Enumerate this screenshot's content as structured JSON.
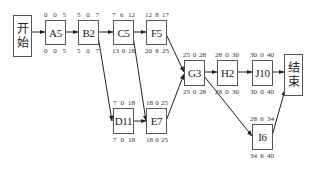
{
  "diagram": {
    "type": "activity-on-node network (critical path)",
    "start_node": {
      "label_line1": "开",
      "label_line2": "始"
    },
    "end_node": {
      "label_line1": "结",
      "label_line2": "束"
    },
    "nodes": [
      {
        "id": "A",
        "label": "A5",
        "top": [
          "0",
          "0",
          "5"
        ],
        "bottom": [
          "0",
          "0",
          "5"
        ]
      },
      {
        "id": "B",
        "label": "B2",
        "top": [
          "5",
          "0",
          "7"
        ],
        "bottom": [
          "5",
          "0",
          "7"
        ]
      },
      {
        "id": "C",
        "label": "C5",
        "top": [
          "7",
          "6",
          "12"
        ],
        "bottom": [
          "13",
          "0",
          "18"
        ]
      },
      {
        "id": "F",
        "label": "F5",
        "top": [
          "12",
          "8",
          "17"
        ],
        "bottom": [
          "20",
          "8",
          "25"
        ]
      },
      {
        "id": "D",
        "label": "D11",
        "top": [
          "7",
          "0",
          "18"
        ],
        "bottom": [
          "7",
          "0",
          "18"
        ]
      },
      {
        "id": "E",
        "label": "E7",
        "top": [
          "18",
          "0",
          "25"
        ],
        "bottom": [
          "18",
          "0",
          "25"
        ]
      },
      {
        "id": "G",
        "label": "G3",
        "top": [
          "25",
          "0",
          "28"
        ],
        "bottom": [
          "25",
          "0",
          "28"
        ]
      },
      {
        "id": "H",
        "label": "H2",
        "top": [
          "28",
          "0",
          "30"
        ],
        "bottom": [
          "28",
          "0",
          "30"
        ]
      },
      {
        "id": "J",
        "label": "J10",
        "top": [
          "30",
          "0",
          "40"
        ],
        "bottom": [
          "30",
          "0",
          "40"
        ]
      },
      {
        "id": "I",
        "label": "I6",
        "top": [
          "28",
          "6",
          "34"
        ],
        "bottom": [
          "34",
          "6",
          "40"
        ]
      }
    ],
    "edges": [
      [
        "start",
        "A"
      ],
      [
        "A",
        "B"
      ],
      [
        "B",
        "C"
      ],
      [
        "C",
        "F"
      ],
      [
        "B",
        "D"
      ],
      [
        "C",
        "E"
      ],
      [
        "D",
        "E"
      ],
      [
        "F",
        "G"
      ],
      [
        "E",
        "G"
      ],
      [
        "G",
        "H"
      ],
      [
        "H",
        "J"
      ],
      [
        "J",
        "end"
      ],
      [
        "G",
        "I"
      ],
      [
        "I",
        "end"
      ]
    ]
  }
}
